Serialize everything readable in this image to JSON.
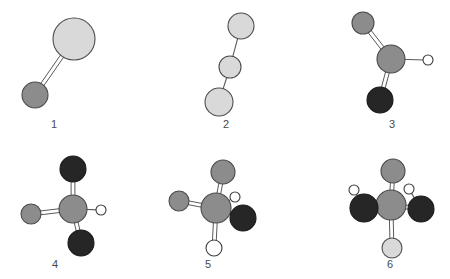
{
  "figure": {
    "background_color": "#ffffff",
    "width": 450,
    "height": 279,
    "panel_count": 6,
    "palette": {
      "atom_large_light_gray": "#d9d9d9",
      "atom_medium_gray": "#8c8c8c",
      "atom_black": "#262626",
      "atom_white": "#ffffff",
      "outline": "#4d4d4d",
      "bond": "#5a5a5a",
      "label_color": "#4a4a4a"
    }
  },
  "panels": [
    {
      "id": "panel-1",
      "label": "1",
      "label_x": 54,
      "label_y": 120,
      "description": "Two-atom unit: large light-gray sphere upper right joined by a double bond to a medium-gray sphere lower left",
      "atoms": [
        {
          "name": "atom-large-light",
          "type": "large-light-gray",
          "cx": 74,
          "cy": 39,
          "r": 21
        },
        {
          "name": "atom-medium-gray",
          "type": "medium-gray",
          "cx": 35,
          "cy": 95,
          "r": 13
        }
      ],
      "bonds": [
        {
          "name": "bond-double-1",
          "order": 2,
          "from": "atom-large-light",
          "to": "atom-medium-gray"
        }
      ]
    },
    {
      "id": "panel-2",
      "label": "2",
      "label_x": 226,
      "label_y": 120,
      "description": "Bent three-atom chain of light-gray spheres: large top right, small middle, large bottom left, joined by single bonds",
      "atoms": [
        {
          "name": "atom-top",
          "type": "large-light-gray",
          "cx": 241,
          "cy": 26,
          "r": 13
        },
        {
          "name": "atom-middle",
          "type": "large-light-gray",
          "cx": 230,
          "cy": 67,
          "r": 11
        },
        {
          "name": "atom-bottom",
          "type": "large-light-gray",
          "cx": 219,
          "cy": 102,
          "r": 14
        }
      ],
      "bonds": [
        {
          "name": "bond-single-top",
          "order": 1,
          "from": "atom-top",
          "to": "atom-middle"
        },
        {
          "name": "bond-single-bottom",
          "order": 1,
          "from": "atom-middle",
          "to": "atom-bottom"
        }
      ]
    },
    {
      "id": "panel-3",
      "label": "3",
      "label_x": 392,
      "label_y": 120,
      "description": "Central medium-gray atom double bonded to a gray atom upper left, double bonded to a black atom below, and single bonded to a small white hydrogen at the right",
      "atoms": [
        {
          "name": "atom-center",
          "type": "medium-gray",
          "cx": 391,
          "cy": 59,
          "r": 14
        },
        {
          "name": "atom-upper-left",
          "type": "medium-gray",
          "cx": 363,
          "cy": 23,
          "r": 11
        },
        {
          "name": "atom-black-below",
          "type": "black",
          "cx": 380,
          "cy": 100,
          "r": 13
        },
        {
          "name": "atom-hydrogen-right",
          "type": "white-small",
          "cx": 428,
          "cy": 60,
          "r": 5
        }
      ],
      "bonds": [
        {
          "name": "bond-double-upper-left",
          "order": 2,
          "from": "atom-center",
          "to": "atom-upper-left"
        },
        {
          "name": "bond-double-below",
          "order": 2,
          "from": "atom-center",
          "to": "atom-black-below"
        },
        {
          "name": "bond-single-hydrogen",
          "order": 1,
          "from": "atom-center",
          "to": "atom-hydrogen-right"
        }
      ]
    },
    {
      "id": "panel-4",
      "label": "4",
      "label_x": 55,
      "label_y": 260,
      "description": "Central gray atom with a black atom double bonded above, a black atom double bonded lower right, a light-gray atom double bonded to the left and a small white hydrogen to the right",
      "atoms": [
        {
          "name": "atom-center",
          "type": "medium-gray",
          "cx": 73,
          "cy": 209,
          "r": 14
        },
        {
          "name": "atom-black-top",
          "type": "black",
          "cx": 73,
          "cy": 169,
          "r": 13
        },
        {
          "name": "atom-black-lower-right",
          "type": "black",
          "cx": 81,
          "cy": 243,
          "r": 13
        },
        {
          "name": "atom-gray-left",
          "type": "medium-gray",
          "cx": 31,
          "cy": 214,
          "r": 10
        },
        {
          "name": "atom-hydrogen-right",
          "type": "white-small",
          "cx": 101,
          "cy": 210,
          "r": 5
        }
      ],
      "bonds": [
        {
          "name": "bond-double-top",
          "order": 2,
          "from": "atom-center",
          "to": "atom-black-top"
        },
        {
          "name": "bond-double-lower-right",
          "order": 2,
          "from": "atom-center",
          "to": "atom-black-lower-right"
        },
        {
          "name": "bond-double-left",
          "order": 2,
          "from": "atom-center",
          "to": "atom-gray-left"
        },
        {
          "name": "bond-single-hydrogen",
          "order": 1,
          "from": "atom-center",
          "to": "atom-hydrogen-right"
        }
      ]
    },
    {
      "id": "panel-5",
      "label": "5",
      "label_x": 208,
      "label_y": 260,
      "description": "Central gray atom bonded to a gray atom above, a gray atom at the left, a small white hydrogen upper right, a black atom lower right and a white atom below",
      "atoms": [
        {
          "name": "atom-center",
          "type": "medium-gray",
          "cx": 216,
          "cy": 208,
          "r": 15
        },
        {
          "name": "atom-gray-top",
          "type": "medium-gray",
          "cx": 223,
          "cy": 172,
          "r": 12
        },
        {
          "name": "atom-gray-left",
          "type": "medium-gray",
          "cx": 179,
          "cy": 201,
          "r": 10
        },
        {
          "name": "atom-hydrogen-upper-right",
          "type": "white-small",
          "cx": 235,
          "cy": 197,
          "r": 5
        },
        {
          "name": "atom-black-lower-right",
          "type": "black",
          "cx": 243,
          "cy": 218,
          "r": 13
        },
        {
          "name": "atom-white-below",
          "type": "white-large",
          "cx": 214,
          "cy": 248,
          "r": 8
        }
      ],
      "bonds": [
        {
          "name": "bond-double-top",
          "order": 2,
          "from": "atom-center",
          "to": "atom-gray-top"
        },
        {
          "name": "bond-double-left",
          "order": 2,
          "from": "atom-center",
          "to": "atom-gray-left"
        },
        {
          "name": "bond-single-hydrogen",
          "order": 1,
          "from": "atom-center",
          "to": "atom-hydrogen-upper-right"
        },
        {
          "name": "bond-single-black",
          "order": 1,
          "from": "atom-center",
          "to": "atom-black-lower-right"
        },
        {
          "name": "bond-double-below",
          "order": 2,
          "from": "atom-center",
          "to": "atom-white-below"
        }
      ]
    },
    {
      "id": "panel-6",
      "label": "6",
      "label_x": 390,
      "label_y": 260,
      "description": "Central gray atom double bonded to a gray atom above and a light atom below, with black atoms at the left and right each carrying a small white hydrogen",
      "atoms": [
        {
          "name": "atom-center",
          "type": "medium-gray",
          "cx": 391,
          "cy": 205,
          "r": 15
        },
        {
          "name": "atom-gray-top",
          "type": "medium-gray",
          "cx": 393,
          "cy": 171,
          "r": 12
        },
        {
          "name": "atom-black-left",
          "type": "black",
          "cx": 364,
          "cy": 208,
          "r": 14
        },
        {
          "name": "atom-black-right",
          "type": "black",
          "cx": 421,
          "cy": 209,
          "r": 13
        },
        {
          "name": "atom-light-below",
          "type": "large-light-gray",
          "cx": 392,
          "cy": 248,
          "r": 10
        },
        {
          "name": "atom-hydrogen-left",
          "type": "white-small",
          "cx": 354,
          "cy": 190,
          "r": 5
        },
        {
          "name": "atom-hydrogen-right",
          "type": "white-small",
          "cx": 409,
          "cy": 189,
          "r": 5
        }
      ],
      "bonds": [
        {
          "name": "bond-double-top",
          "order": 2,
          "from": "atom-center",
          "to": "atom-gray-top"
        },
        {
          "name": "bond-single-black-left",
          "order": 1,
          "from": "atom-center",
          "to": "atom-black-left"
        },
        {
          "name": "bond-double-black-right",
          "order": 2,
          "from": "atom-center",
          "to": "atom-black-right"
        },
        {
          "name": "bond-double-below",
          "order": 2,
          "from": "atom-center",
          "to": "atom-light-below"
        },
        {
          "name": "bond-hydrogen-left",
          "order": 1,
          "from": "atom-black-left",
          "to": "atom-hydrogen-left"
        },
        {
          "name": "bond-hydrogen-right",
          "order": 1,
          "from": "atom-black-right",
          "to": "atom-hydrogen-right"
        }
      ]
    }
  ]
}
